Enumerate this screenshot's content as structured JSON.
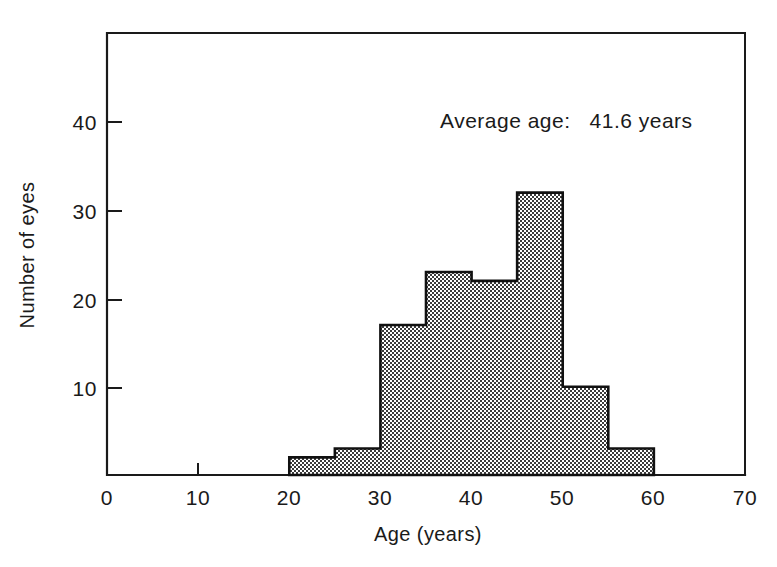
{
  "chart_data": {
    "type": "bar",
    "title": "",
    "subtitle": "",
    "xlabel": "Age (years)",
    "ylabel": "Number of eyes",
    "xlim": [
      0,
      70
    ],
    "ylim": [
      0,
      50
    ],
    "grid": false,
    "legend": null,
    "bin_width": 5,
    "categories": [
      "20-25",
      "25-30",
      "30-35",
      "35-40",
      "40-45",
      "45-50",
      "50-55",
      "55-60"
    ],
    "bin_edges": [
      20,
      25,
      30,
      35,
      40,
      45,
      50,
      55,
      60
    ],
    "values": [
      2,
      3,
      17,
      23,
      22,
      32,
      10,
      3
    ],
    "xticks": [
      0,
      10,
      20,
      30,
      40,
      50,
      60,
      70
    ],
    "xtick_labels": [
      "0",
      "10",
      "20",
      "30",
      "40",
      "50",
      "60",
      "70"
    ],
    "yticks": [
      10,
      20,
      30,
      40
    ],
    "ytick_labels": [
      "10",
      "20",
      "30",
      "40"
    ],
    "annotations": [
      {
        "name": "average-age",
        "text": "Average age:   41.6 years",
        "x": 41.6,
        "value": "41.6",
        "units": "years"
      }
    ],
    "series_fill": "#8c8c8c",
    "series_edge": "#111111"
  },
  "colors": {
    "background": "#ffffff",
    "ink": "#1a1a1a",
    "bar_fill": "#8c8c8c",
    "bar_edge": "#111111"
  }
}
